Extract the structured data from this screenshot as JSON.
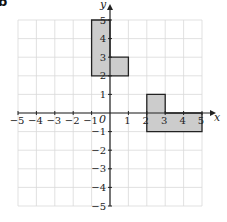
{
  "panel_label": "b",
  "axes": {
    "x_label": "x",
    "y_label": "y",
    "origin_label": "0",
    "x_ticks": [
      "−5",
      "−4",
      "−3",
      "−2",
      "−1",
      "1",
      "2",
      "3",
      "4",
      "5"
    ],
    "y_ticks": [
      "5",
      "4",
      "3",
      "2",
      "1",
      "−1",
      "−2",
      "−3",
      "−4",
      "−5"
    ]
  },
  "colors": {
    "grid": "#d9d9d9",
    "axis": "#222222",
    "shape_fill": "#cccccc",
    "shape_stroke": "#222222"
  },
  "shapes": [
    {
      "name": "upper-shape",
      "vertices": [
        [
          -1,
          2
        ],
        [
          -1,
          5
        ],
        [
          0,
          5
        ],
        [
          0,
          3
        ],
        [
          1,
          3
        ],
        [
          1,
          2
        ]
      ]
    },
    {
      "name": "lower-shape",
      "vertices": [
        [
          2,
          -1
        ],
        [
          2,
          1
        ],
        [
          3,
          1
        ],
        [
          3,
          0
        ],
        [
          5,
          0
        ],
        [
          5,
          -1
        ]
      ]
    }
  ]
}
